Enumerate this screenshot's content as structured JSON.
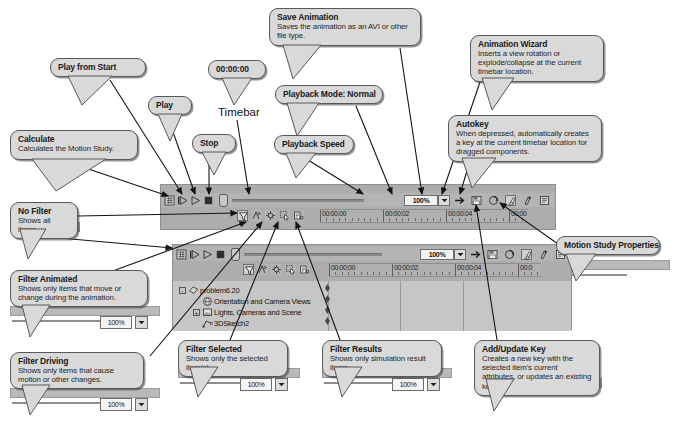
{
  "meta": {
    "app": "SolidWorks MotionManager",
    "figure_caption": "Annotated MotionManager toolbar reference"
  },
  "plain_labels": [
    {
      "name": "timebar-label",
      "text": "Timebar",
      "x": 218,
      "y": 106
    }
  ],
  "callouts": [
    {
      "id": "calculate",
      "title": "Calculate",
      "body": "Calculates the Motion Study.",
      "x": 10,
      "y": 130,
      "w": 128,
      "h": 30,
      "tail": {
        "x1": 22,
        "y1": 30,
        "x2": 46,
        "y2": 62,
        "x3": 96,
        "y3": 30
      }
    },
    {
      "id": "play-from-start",
      "title": "Play from Start",
      "body": "",
      "x": 50,
      "y": 58,
      "w": 96,
      "h": 19,
      "tail": {
        "x1": 18,
        "y1": 19,
        "x2": 32,
        "y2": 48,
        "x3": 62,
        "y3": 19
      }
    },
    {
      "id": "play",
      "title": "Play",
      "body": "",
      "x": 148,
      "y": 96,
      "w": 44,
      "h": 19,
      "tail": {
        "x1": 10,
        "y1": 19,
        "x2": 22,
        "y2": 46,
        "x3": 34,
        "y3": 19
      }
    },
    {
      "id": "stop",
      "title": "Stop",
      "body": "",
      "x": 192,
      "y": 134,
      "w": 44,
      "h": 19,
      "tail": {
        "x1": 10,
        "y1": 19,
        "x2": 22,
        "y2": 42,
        "x3": 34,
        "y3": 19
      }
    },
    {
      "id": "timebar-time",
      "title": "00:00:00",
      "body": "",
      "x": 208,
      "y": 60,
      "w": 58,
      "h": 19,
      "tail": {
        "x1": 14,
        "y1": 19,
        "x2": 26,
        "y2": 46,
        "x3": 44,
        "y3": 19
      }
    },
    {
      "id": "save-animation",
      "title": "Save Animation",
      "body": "Saves the animation as an AVI or other file type.",
      "x": 269,
      "y": 8,
      "w": 152,
      "h": 38,
      "tail": {
        "x1": 14,
        "y1": 38,
        "x2": 24,
        "y2": 72,
        "x3": 52,
        "y3": 38
      }
    },
    {
      "id": "playback-mode",
      "title": "Playback Mode: Normal",
      "body": "",
      "x": 275,
      "y": 85,
      "w": 108,
      "h": 19,
      "tail": {
        "x1": 12,
        "y1": 19,
        "x2": 22,
        "y2": 52,
        "x3": 44,
        "y3": 19
      }
    },
    {
      "id": "playback-speed",
      "title": "Playback Speed",
      "body": "",
      "x": 274,
      "y": 135,
      "w": 80,
      "h": 19,
      "tail": {
        "x1": 12,
        "y1": 19,
        "x2": 22,
        "y2": 44,
        "x3": 42,
        "y3": 19
      }
    },
    {
      "id": "animation-wizard",
      "title": "Animation Wizard",
      "body": "Inserts a view rotation or explode/collapse at the current timebar location.",
      "x": 470,
      "y": 35,
      "w": 134,
      "h": 44,
      "tail": {
        "x1": 12,
        "y1": 44,
        "x2": 22,
        "y2": 76,
        "x3": 44,
        "y3": 44
      }
    },
    {
      "id": "autokey",
      "title": "Autokey",
      "body": "When depressed, automatically creates a key at the current timebar location for dragged components.",
      "x": 448,
      "y": 115,
      "w": 154,
      "h": 44,
      "tail": {
        "x1": 14,
        "y1": 44,
        "x2": 24,
        "y2": 74,
        "x3": 48,
        "y3": 44
      }
    },
    {
      "id": "motion-study-properties",
      "title": "Motion Study Properties",
      "body": "",
      "x": 556,
      "y": 236,
      "w": 104,
      "h": 19,
      "tail": {
        "x1": 10,
        "y1": 19,
        "x2": 20,
        "y2": 46,
        "x3": 40,
        "y3": 19
      }
    },
    {
      "id": "no-filter",
      "title": "No Filter",
      "body": "Shows all items.",
      "x": 10,
      "y": 202,
      "w": 68,
      "h": 28,
      "tail": {
        "x1": 10,
        "y1": 28,
        "x2": 18,
        "y2": 58,
        "x3": 36,
        "y3": 28
      }
    },
    {
      "id": "filter-animated",
      "title": "Filter Animated",
      "body": "Shows only items that move or change during the animation.",
      "x": 10,
      "y": 270,
      "w": 138,
      "h": 36,
      "tail": {
        "x1": 12,
        "y1": 36,
        "x2": 20,
        "y2": 68,
        "x3": 40,
        "y3": 36
      }
    },
    {
      "id": "filter-driving",
      "title": "Filter Driving",
      "body": "Shows only items that cause motion or other changes.",
      "x": 10,
      "y": 352,
      "w": 134,
      "h": 34,
      "tail": {
        "x1": 12,
        "y1": 34,
        "x2": 20,
        "y2": 64,
        "x3": 40,
        "y3": 34
      }
    },
    {
      "id": "filter-selected",
      "title": "Filter Selected",
      "body": "Shows only the selected item(s).",
      "x": 178,
      "y": 340,
      "w": 110,
      "h": 28,
      "tail": {
        "x1": 12,
        "y1": 28,
        "x2": 20,
        "y2": 58,
        "x3": 40,
        "y3": 28
      }
    },
    {
      "id": "filter-results",
      "title": "Filter Results",
      "body": "Shows only simulation result items.",
      "x": 322,
      "y": 340,
      "w": 120,
      "h": 28,
      "tail": {
        "x1": 12,
        "y1": 28,
        "x2": 20,
        "y2": 58,
        "x3": 40,
        "y3": 28
      }
    },
    {
      "id": "add-update-key",
      "title": "Add/Update Key",
      "body": "Creates a new key with the selected item's current attributes, or updates an existing key.",
      "x": 474,
      "y": 340,
      "w": 126,
      "h": 40,
      "tail": {
        "x1": 12,
        "y1": 40,
        "x2": 20,
        "y2": 72,
        "x3": 40,
        "y3": 40
      }
    }
  ],
  "arrows": [
    {
      "name": "arrow-calculate",
      "x1": 56,
      "y1": 158,
      "x2": 168,
      "y2": 196
    },
    {
      "name": "arrow-play-from-start",
      "x1": 110,
      "y1": 80,
      "x2": 182,
      "y2": 194
    },
    {
      "name": "arrow-play",
      "x1": 168,
      "y1": 118,
      "x2": 195,
      "y2": 194
    },
    {
      "name": "arrow-stop",
      "x1": 209,
      "y1": 157,
      "x2": 209,
      "y2": 194
    },
    {
      "name": "arrow-timebar",
      "x1": 237,
      "y1": 120,
      "x2": 249,
      "y2": 194
    },
    {
      "name": "arrow-save-animation",
      "x1": 400,
      "y1": 48,
      "x2": 422,
      "y2": 194
    },
    {
      "name": "arrow-playback-mode",
      "x1": 356,
      "y1": 106,
      "x2": 392,
      "y2": 194
    },
    {
      "name": "arrow-playback-speed",
      "x1": 300,
      "y1": 155,
      "x2": 363,
      "y2": 194
    },
    {
      "name": "arrow-animation-wizard",
      "x1": 480,
      "y1": 82,
      "x2": 442,
      "y2": 194
    },
    {
      "name": "arrow-autokey",
      "x1": 470,
      "y1": 161,
      "x2": 460,
      "y2": 194
    },
    {
      "name": "arrow-motion-props",
      "x1": 558,
      "y1": 244,
      "x2": 500,
      "y2": 203
    },
    {
      "name": "arrow-add-update-key",
      "x1": 497,
      "y1": 340,
      "x2": 476,
      "y2": 205
    },
    {
      "name": "arrow-no-filter",
      "x1": 78,
      "y1": 216,
      "x2": 237,
      "y2": 213
    },
    {
      "name": "arrow-filter-animated",
      "x1": 110,
      "y1": 272,
      "x2": 246,
      "y2": 222
    },
    {
      "name": "arrow-filter-driving",
      "x1": 150,
      "y1": 356,
      "x2": 262,
      "y2": 222
    },
    {
      "name": "arrow-filter-selected",
      "x1": 230,
      "y1": 340,
      "x2": 278,
      "y2": 222
    },
    {
      "name": "arrow-filter-results",
      "x1": 340,
      "y1": 340,
      "x2": 296,
      "y2": 222
    },
    {
      "name": "arrow-no-filter-2",
      "x1": 60,
      "y1": 238,
      "x2": 172,
      "y2": 248
    }
  ],
  "mm_upper": {
    "name": "motionmanager-upper",
    "x": 160,
    "y": 184,
    "w": 396,
    "h": 46,
    "playback_buttons": [
      {
        "name": "calculate-icon",
        "glyph": "calculate"
      },
      {
        "name": "play-from-start-icon",
        "glyph": "play-from-start"
      },
      {
        "name": "play-icon",
        "glyph": "play"
      },
      {
        "name": "stop-icon",
        "glyph": "stop"
      }
    ],
    "timebar_time": "00:00:00",
    "playback_speed": "100%",
    "speed_options": [
      "100%"
    ],
    "right_buttons": [
      {
        "name": "playback-mode-icon",
        "glyph": "arrow-right",
        "pressed": false
      },
      {
        "name": "save-animation-icon",
        "glyph": "save",
        "pressed": false
      },
      {
        "name": "animation-wizard-icon",
        "glyph": "wizard",
        "pressed": false
      },
      {
        "name": "autokey-icon",
        "glyph": "key",
        "pressed": true
      },
      {
        "name": "add-update-key-icon",
        "glyph": "addkey",
        "pressed": false
      },
      {
        "name": "motion-study-properties-icon",
        "glyph": "props",
        "pressed": false
      }
    ],
    "filter_buttons": [
      {
        "name": "no-filter-icon",
        "glyph": "funnel",
        "pressed": true
      },
      {
        "name": "filter-animated-icon",
        "glyph": "animated",
        "pressed": false
      },
      {
        "name": "filter-driving-icon",
        "glyph": "driving",
        "pressed": false
      },
      {
        "name": "filter-selected-icon",
        "glyph": "selected",
        "pressed": false
      },
      {
        "name": "filter-results-icon",
        "glyph": "results",
        "pressed": false
      }
    ],
    "ruler_labels": [
      "00:00:00",
      "00:00:02",
      "00:00:04",
      "00:00"
    ]
  },
  "mm_lower": {
    "name": "motionmanager-lower",
    "x": 172,
    "y": 244,
    "w": 400,
    "h": 86,
    "timebar_time": "00:00:00",
    "playback_speed": "100%",
    "ruler_labels": [
      "00:00:00",
      "00:00:02",
      "00:00:04",
      "00:0"
    ],
    "tree": [
      {
        "name": "tree-item-problem",
        "label": "problem6.20",
        "indent": 0,
        "icon": "assembly-icon",
        "expander": "-"
      },
      {
        "name": "tree-item-orientation",
        "label": "Orientation and Camera Views",
        "indent": 1,
        "icon": "camera-views-icon",
        "expander": ""
      },
      {
        "name": "tree-item-lights",
        "label": "Lights, Cameras and Scene",
        "indent": 1,
        "icon": "lights-icon",
        "expander": "+"
      },
      {
        "name": "tree-item-sketch",
        "label": "3DSketch2",
        "indent": 1,
        "icon": "sketch-icon",
        "expander": ""
      }
    ],
    "keys": [
      {
        "row": 0
      },
      {
        "row": 1
      },
      {
        "row": 2
      },
      {
        "row": 3
      }
    ]
  },
  "fragments": [
    {
      "name": "fragment-no-filter",
      "x": 10,
      "y": 216,
      "w": 68,
      "h": 22,
      "zoom": "",
      "has_zoom": false
    },
    {
      "name": "fragment-filter-animated",
      "x": 10,
      "y": 296,
      "w": 148,
      "h": 34,
      "zoom": "100%",
      "has_zoom": true
    },
    {
      "name": "fragment-filter-driving",
      "x": 10,
      "y": 378,
      "w": 148,
      "h": 34,
      "zoom": "100%",
      "has_zoom": true
    },
    {
      "name": "fragment-filter-selected",
      "x": 178,
      "y": 358,
      "w": 120,
      "h": 34,
      "zoom": "100%",
      "has_zoom": true
    },
    {
      "name": "fragment-filter-results",
      "x": 322,
      "y": 358,
      "w": 128,
      "h": 34,
      "zoom": "100%",
      "has_zoom": true
    },
    {
      "name": "fragment-add-update-key",
      "x": 474,
      "y": 370,
      "w": 126,
      "h": 30,
      "zoom": "",
      "has_zoom": false
    },
    {
      "name": "fragment-motion-props",
      "x": 556,
      "y": 250,
      "w": 112,
      "h": 34,
      "zoom": "",
      "has_zoom": false
    }
  ],
  "colors": {
    "bubble_fill": "#d9d9d9",
    "bubble_border": "#58585a",
    "panel_bg": "#adadad",
    "toolbar_bg": "#b4b4b4",
    "tree_bg": "#c6c6c6",
    "arrow": "#1a1a1a",
    "text": "#1a1a1a"
  }
}
